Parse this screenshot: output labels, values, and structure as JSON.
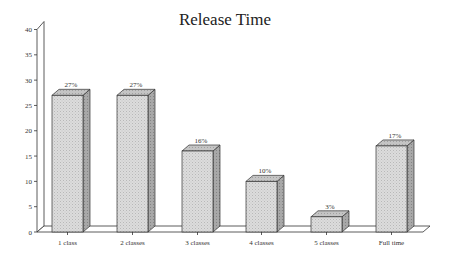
{
  "chart_data": {
    "type": "bar",
    "style": "3d",
    "title": "Release Time",
    "xlabel": "",
    "ylabel": "",
    "categories": [
      "1 class",
      "2 classes",
      "3 classes",
      "4 classes",
      "5 classes",
      "Full time"
    ],
    "values": [
      27,
      27,
      16,
      10,
      3,
      17
    ],
    "data_labels": [
      "27%",
      "27%",
      "16%",
      "10%",
      "3%",
      "17%"
    ],
    "ylim": [
      0,
      40
    ],
    "yticks": [
      0,
      5,
      10,
      15,
      20,
      25,
      30,
      35,
      40
    ],
    "grid": false,
    "legend": null,
    "colors": {
      "bar_front": "#d4d4d4",
      "bar_top": "#bdbdbd",
      "bar_side": "#9a9a9a",
      "outline": "#333333",
      "axis": "#333333"
    }
  }
}
